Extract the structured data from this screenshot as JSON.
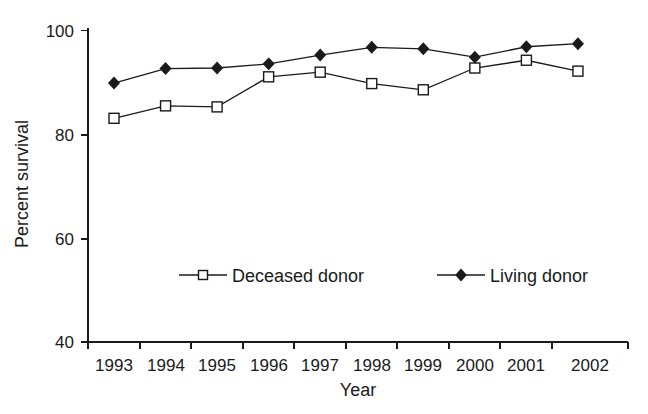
{
  "chart_data": {
    "type": "line",
    "title": "",
    "xlabel": "Year",
    "ylabel": "Percent survival",
    "categories": [
      "1993",
      "1994",
      "1995",
      "1996",
      "1997",
      "1998",
      "1999",
      "2000",
      "2001",
      "2002"
    ],
    "x": [
      1993,
      1994,
      1995,
      1996,
      1997,
      1998,
      1999,
      2000,
      2001,
      2002
    ],
    "series": [
      {
        "name": "Deceased donor",
        "marker": "open-square",
        "values": [
          83.1,
          85.5,
          85.3,
          91.1,
          92.0,
          89.8,
          88.6,
          92.8,
          94.3,
          92.2
        ]
      },
      {
        "name": "Living donor",
        "marker": "filled-diamond",
        "values": [
          89.9,
          92.7,
          92.8,
          93.6,
          95.3,
          96.8,
          96.5,
          94.9,
          96.9,
          97.5
        ]
      }
    ],
    "ylim": [
      40,
      100
    ],
    "xlim": [
      1992.5,
      2002.5
    ],
    "ytick_labels": [
      "100",
      "80",
      "60",
      "40"
    ],
    "yticks": [
      100,
      80,
      60,
      40
    ],
    "grid": false,
    "legend_position": "inside-bottom-center",
    "legend_entries": [
      "Deceased donor",
      "Living donor"
    ]
  },
  "axes": {
    "y_title": "Percent survival",
    "x_title": "Year"
  },
  "legend": {
    "deceased_label": "Deceased donor",
    "living_label": "Living donor"
  },
  "colors": {
    "ink": "#1a1a1a",
    "background": "#ffffff"
  }
}
